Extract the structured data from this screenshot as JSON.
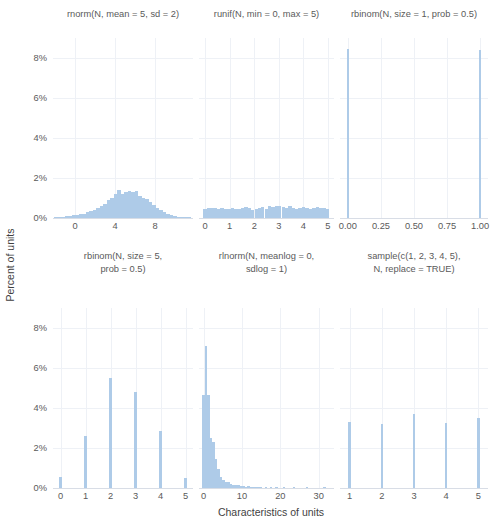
{
  "chart_data": {
    "type": "bar",
    "title": "",
    "xlabel": "Characteristics of units",
    "ylabel": "Percent of units",
    "grid": true,
    "legend": "none",
    "ylim": [
      0,
      9
    ],
    "y_ticks": [
      "0%",
      "2%",
      "4%",
      "6%",
      "8%"
    ],
    "y_tick_values": [
      0,
      2,
      4,
      6,
      8
    ],
    "panels": [
      {
        "id": "rnorm",
        "title": "rnorm(N, mean = 5, sd = 2)",
        "row": 0,
        "col": 0,
        "xlim": [
          -2.2,
          11.8
        ],
        "x_ticks": [
          "0",
          "4",
          "8"
        ],
        "x_tick_values": [
          0,
          4,
          8
        ],
        "bin_width": 0.35,
        "bins": [
          {
            "x": -1.9,
            "v": 0.02
          },
          {
            "x": -1.55,
            "v": 0.03
          },
          {
            "x": -1.2,
            "v": 0.05
          },
          {
            "x": -0.85,
            "v": 0.08
          },
          {
            "x": -0.5,
            "v": 0.1
          },
          {
            "x": -0.15,
            "v": 0.14
          },
          {
            "x": 0.2,
            "v": 0.17
          },
          {
            "x": 0.55,
            "v": 0.2
          },
          {
            "x": 0.9,
            "v": 0.22
          },
          {
            "x": 1.25,
            "v": 0.3
          },
          {
            "x": 1.6,
            "v": 0.36
          },
          {
            "x": 1.95,
            "v": 0.42
          },
          {
            "x": 2.3,
            "v": 0.5
          },
          {
            "x": 2.65,
            "v": 0.58
          },
          {
            "x": 3.0,
            "v": 0.72
          },
          {
            "x": 3.35,
            "v": 0.88
          },
          {
            "x": 3.7,
            "v": 1.0
          },
          {
            "x": 4.05,
            "v": 1.18
          },
          {
            "x": 4.4,
            "v": 1.4
          },
          {
            "x": 4.75,
            "v": 1.22
          },
          {
            "x": 5.1,
            "v": 1.3
          },
          {
            "x": 5.45,
            "v": 1.36
          },
          {
            "x": 5.8,
            "v": 1.28
          },
          {
            "x": 6.15,
            "v": 1.36
          },
          {
            "x": 6.5,
            "v": 1.1
          },
          {
            "x": 6.85,
            "v": 1.0
          },
          {
            "x": 7.2,
            "v": 0.95
          },
          {
            "x": 7.55,
            "v": 0.82
          },
          {
            "x": 7.9,
            "v": 0.66
          },
          {
            "x": 8.25,
            "v": 0.52
          },
          {
            "x": 8.6,
            "v": 0.4
          },
          {
            "x": 8.95,
            "v": 0.28
          },
          {
            "x": 9.3,
            "v": 0.2
          },
          {
            "x": 9.65,
            "v": 0.14
          },
          {
            "x": 10.0,
            "v": 0.12
          },
          {
            "x": 10.35,
            "v": 0.07
          },
          {
            "x": 10.7,
            "v": 0.04
          },
          {
            "x": 11.05,
            "v": 0.03
          },
          {
            "x": 11.4,
            "v": 0.02
          }
        ]
      },
      {
        "id": "runif",
        "title": "runif(N, min = 0, max = 5)",
        "row": 0,
        "col": 1,
        "xlim": [
          -0.25,
          5.25
        ],
        "x_ticks": [
          "0",
          "1",
          "2",
          "3",
          "4",
          "5"
        ],
        "x_tick_values": [
          0,
          1,
          2,
          3,
          4,
          5
        ],
        "bin_width": 0.135,
        "bins": [
          {
            "x": 0.0,
            "v": 0.45
          },
          {
            "x": 0.14,
            "v": 0.52
          },
          {
            "x": 0.28,
            "v": 0.48
          },
          {
            "x": 0.42,
            "v": 0.5
          },
          {
            "x": 0.55,
            "v": 0.46
          },
          {
            "x": 0.69,
            "v": 0.5
          },
          {
            "x": 0.83,
            "v": 0.44
          },
          {
            "x": 0.97,
            "v": 0.46
          },
          {
            "x": 1.11,
            "v": 0.48
          },
          {
            "x": 1.25,
            "v": 0.46
          },
          {
            "x": 1.38,
            "v": 0.44
          },
          {
            "x": 1.52,
            "v": 0.5
          },
          {
            "x": 1.66,
            "v": 0.56
          },
          {
            "x": 1.8,
            "v": 0.48
          },
          {
            "x": 1.94,
            "v": 0.42
          },
          {
            "x": 2.08,
            "v": 0.47
          },
          {
            "x": 2.21,
            "v": 0.5
          },
          {
            "x": 2.35,
            "v": 0.53
          },
          {
            "x": 2.49,
            "v": 0.45
          },
          {
            "x": 2.63,
            "v": 0.6
          },
          {
            "x": 2.77,
            "v": 0.57
          },
          {
            "x": 2.91,
            "v": 0.62
          },
          {
            "x": 3.04,
            "v": 0.58
          },
          {
            "x": 3.18,
            "v": 0.55
          },
          {
            "x": 3.32,
            "v": 0.52
          },
          {
            "x": 3.46,
            "v": 0.6
          },
          {
            "x": 3.6,
            "v": 0.5
          },
          {
            "x": 3.74,
            "v": 0.47
          },
          {
            "x": 3.87,
            "v": 0.52
          },
          {
            "x": 4.01,
            "v": 0.54
          },
          {
            "x": 4.15,
            "v": 0.5
          },
          {
            "x": 4.29,
            "v": 0.45
          },
          {
            "x": 4.43,
            "v": 0.48
          },
          {
            "x": 4.57,
            "v": 0.55
          },
          {
            "x": 4.7,
            "v": 0.52
          },
          {
            "x": 4.84,
            "v": 0.5
          },
          {
            "x": 4.98,
            "v": 0.44
          }
        ]
      },
      {
        "id": "rbinom1",
        "title": "rbinom(N, size = 1, prob = 0.5)",
        "row": 0,
        "col": 2,
        "xlim": [
          -0.06,
          1.06
        ],
        "x_ticks": [
          "0.00",
          "0.25",
          "0.50",
          "0.75",
          "1.00"
        ],
        "x_tick_values": [
          0,
          0.25,
          0.5,
          0.75,
          1.0
        ],
        "bin_width": 0.016,
        "bins": [
          {
            "x": 0.0,
            "v": 8.45
          },
          {
            "x": 1.0,
            "v": 8.4
          }
        ]
      },
      {
        "id": "rbinom5",
        "title": "rbinom(N, size = 5,\nprob = 0.5)",
        "row": 1,
        "col": 0,
        "xlim": [
          -0.3,
          5.3
        ],
        "x_ticks": [
          "0",
          "1",
          "2",
          "3",
          "4",
          "5"
        ],
        "x_tick_values": [
          0,
          1,
          2,
          3,
          4,
          5
        ],
        "bin_width": 0.09,
        "bins": [
          {
            "x": 0,
            "v": 0.55
          },
          {
            "x": 1,
            "v": 2.6
          },
          {
            "x": 2,
            "v": 5.5
          },
          {
            "x": 3,
            "v": 4.8
          },
          {
            "x": 4,
            "v": 2.85
          },
          {
            "x": 5,
            "v": 0.5
          }
        ]
      },
      {
        "id": "rlnorm",
        "title": "rlnorm(N, meanlog = 0,\nsdlog = 1)",
        "row": 1,
        "col": 1,
        "xlim": [
          -1.2,
          34
        ],
        "x_ticks": [
          "0",
          "10",
          "20",
          "30"
        ],
        "x_tick_values": [
          0,
          10,
          20,
          30
        ],
        "bin_width": 0.62,
        "bins": [
          {
            "x": 0.0,
            "v": 4.65
          },
          {
            "x": 0.65,
            "v": 7.1
          },
          {
            "x": 1.3,
            "v": 4.65
          },
          {
            "x": 1.95,
            "v": 2.5
          },
          {
            "x": 2.6,
            "v": 2.3
          },
          {
            "x": 3.25,
            "v": 1.45
          },
          {
            "x": 3.9,
            "v": 0.95
          },
          {
            "x": 4.55,
            "v": 0.55
          },
          {
            "x": 5.2,
            "v": 0.42
          },
          {
            "x": 5.85,
            "v": 0.3
          },
          {
            "x": 6.5,
            "v": 0.28
          },
          {
            "x": 7.15,
            "v": 0.2
          },
          {
            "x": 7.8,
            "v": 0.17
          },
          {
            "x": 8.45,
            "v": 0.15
          },
          {
            "x": 9.1,
            "v": 0.13
          },
          {
            "x": 9.75,
            "v": 0.12
          },
          {
            "x": 10.4,
            "v": 0.1
          },
          {
            "x": 11.05,
            "v": 0.07
          },
          {
            "x": 11.7,
            "v": 0.1
          },
          {
            "x": 12.35,
            "v": 0.06
          },
          {
            "x": 13.0,
            "v": 0.05
          },
          {
            "x": 13.65,
            "v": 0.04
          },
          {
            "x": 14.3,
            "v": 0.04
          },
          {
            "x": 15.0,
            "v": 0.03
          },
          {
            "x": 16.2,
            "v": 0.03
          },
          {
            "x": 17.5,
            "v": 0.02
          },
          {
            "x": 19.0,
            "v": 0.02
          },
          {
            "x": 21.0,
            "v": 0.02
          },
          {
            "x": 23.5,
            "v": 0.02
          },
          {
            "x": 27.0,
            "v": 0.02
          },
          {
            "x": 31.5,
            "v": 0.03
          }
        ]
      },
      {
        "id": "sample",
        "title": "sample(c(1, 2, 3, 4, 5),\nN, replace = TRUE)",
        "row": 1,
        "col": 2,
        "xlim": [
          0.7,
          5.3
        ],
        "x_ticks": [
          "1",
          "2",
          "3",
          "4",
          "5"
        ],
        "x_tick_values": [
          1,
          2,
          3,
          4,
          5
        ],
        "bin_width": 0.075,
        "bins": [
          {
            "x": 1,
            "v": 3.3
          },
          {
            "x": 2,
            "v": 3.22
          },
          {
            "x": 3,
            "v": 3.72
          },
          {
            "x": 4,
            "v": 3.25
          },
          {
            "x": 5,
            "v": 3.48
          }
        ]
      }
    ]
  },
  "style": {
    "bar_color": "#aecbe8",
    "grid_color": "#eef1f6",
    "axis_color": "#d8dde6",
    "text_color": "#5a5a5a",
    "background": "#ffffff"
  }
}
